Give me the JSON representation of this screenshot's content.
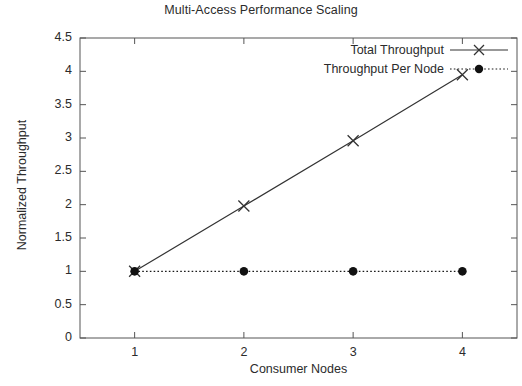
{
  "chart_data": {
    "type": "line",
    "title": "Multi-Access Performance Scaling",
    "xlabel": "Consumer Nodes",
    "ylabel": "Normalized Throughput",
    "x": [
      1,
      2,
      3,
      4
    ],
    "xlim": [
      0.5,
      4.5
    ],
    "ylim": [
      0,
      4.5
    ],
    "grid": false,
    "legend_position": "top-right inside",
    "xticks": [
      "1",
      "2",
      "3",
      "4"
    ],
    "yticks": [
      "0",
      "0.5",
      "1",
      "1.5",
      "2",
      "2.5",
      "3",
      "3.5",
      "4",
      "4.5"
    ],
    "ytick_values": [
      0,
      0.5,
      1,
      1.5,
      2,
      2.5,
      3,
      3.5,
      4,
      4.5
    ],
    "series": [
      {
        "name": "Total Throughput",
        "values": [
          1,
          1.98,
          2.96,
          3.95
        ],
        "marker": "x-cross",
        "linestyle": "solid",
        "color": "#333333"
      },
      {
        "name": "Throughput Per Node",
        "values": [
          1,
          1,
          1,
          1
        ],
        "marker": "filled-circle",
        "linestyle": "dotted",
        "color": "#1a1a1a"
      }
    ]
  },
  "colors": {
    "axis": "#555555",
    "ink": "#2b2b2b",
    "background": "#ffffff"
  }
}
